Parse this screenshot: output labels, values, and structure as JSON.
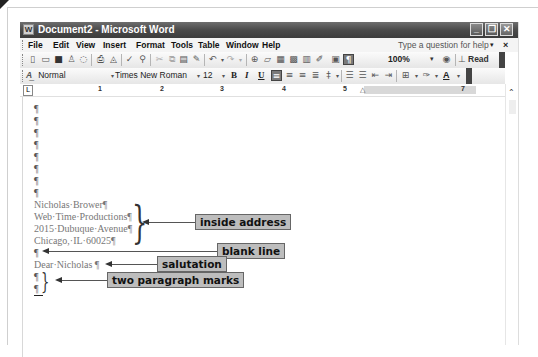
{
  "window": {
    "title": "Document2 - Microsoft Word",
    "controls": {
      "minimize": "_",
      "restore": "❐",
      "close": "✕"
    }
  },
  "menubar": {
    "items": [
      {
        "label": "File",
        "accel": "F"
      },
      {
        "label": "Edit",
        "accel": "E"
      },
      {
        "label": "View",
        "accel": "V"
      },
      {
        "label": "Insert",
        "accel": "I"
      },
      {
        "label": "Format",
        "accel": "o"
      },
      {
        "label": "Tools",
        "accel": "T"
      },
      {
        "label": "Table",
        "accel": "a"
      },
      {
        "label": "Window",
        "accel": "W"
      },
      {
        "label": "Help",
        "accel": "H"
      }
    ],
    "help_placeholder": "Type a question for help",
    "help_dropdown": "▾",
    "close_doc": "×"
  },
  "standard_toolbar": {
    "icons": [
      "new-icon",
      "open-icon",
      "save-icon",
      "permission-icon",
      "email-icon",
      "print-icon",
      "print-preview-icon",
      "spelling-icon",
      "research-icon",
      "cut-icon",
      "copy-icon",
      "paste-icon",
      "format-painter-icon",
      "undo-icon",
      "redo-icon",
      "hyperlink-icon",
      "tables-borders-icon",
      "insert-table-icon",
      "insert-excel-icon",
      "columns-icon",
      "drawing-icon",
      "document-map-icon",
      "show-hide-icon"
    ],
    "zoom": "100%",
    "read_label": "Read",
    "show_hide_glyph": "¶"
  },
  "formatting_toolbar": {
    "style": "Normal",
    "font": "Times New Roman",
    "size": "12",
    "bold": "B",
    "italic": "I",
    "underline": "U",
    "font_color_glyph": "A"
  },
  "ruler": {
    "numbers": [
      "1",
      "2",
      "3",
      "4",
      "5",
      "7"
    ],
    "tab_selector": "L"
  },
  "document": {
    "blank_paragraphs": [
      "¶",
      "¶",
      "¶",
      "¶",
      "¶",
      "¶",
      "¶",
      "¶"
    ],
    "inside_address": [
      "Nicholas·Brower¶",
      "Web·Time·Productions¶",
      "2015·Dubuque·Avenue¶",
      "Chicago,·IL·60025¶"
    ],
    "blank_line": "¶",
    "salutation": "Dear·Nicholas ¶",
    "two_marks": [
      "¶",
      "¶"
    ]
  },
  "callouts": {
    "inside_address": "inside address",
    "blank_line": "blank line",
    "salutation": "salutation",
    "two_paragraph_marks": "two paragraph marks"
  }
}
